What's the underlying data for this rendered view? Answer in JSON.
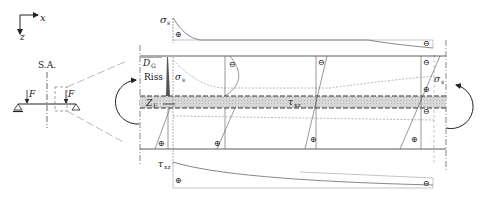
{
  "axes": {
    "x_label": "x",
    "z_label": "z"
  },
  "beam": {
    "symmetry_label": "S.A.",
    "load_left": "F",
    "load_right": "F"
  },
  "detail": {
    "crack_label": "Riss",
    "dg_label": "D",
    "dg_sub": "G",
    "zf_label": "Z",
    "zf_sub": "F",
    "sigma_s_top": "σ",
    "sigma_s_top_sub": "s",
    "sigma_s_inner": "σ",
    "sigma_s_inner_sub": "s",
    "sigma_s_right": "σ",
    "sigma_s_right_sub": "s",
    "tau_bond": "τ",
    "tau_bond_sub": "xz",
    "tau_bottom": "τ",
    "tau_bottom_sub": "xz",
    "plus": "⊕",
    "minus": "⊖"
  }
}
